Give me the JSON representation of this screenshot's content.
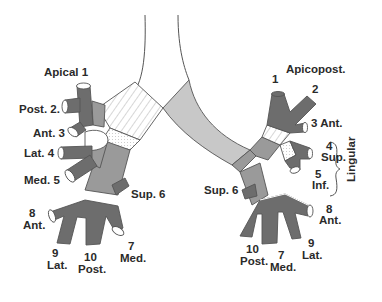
{
  "colors": {
    "background": "#ffffff",
    "outline": "#555555",
    "dark_segment": "#6d6d6d",
    "mid_segment": "#9a9a9a",
    "light_segment": "#c8c8c8",
    "pale_segment": "#e6e6e6",
    "label": "#2a2a2a"
  },
  "right_lung": {
    "labels": {
      "apical": "Apical 1",
      "posterior": "Post. 2.",
      "anterior": "Ant. 3",
      "lateral": "Lat. 4",
      "medial": "Med. 5",
      "superior": "Sup. 6",
      "anterior_basal_num": "8",
      "anterior_basal": "Ant.",
      "lateral_basal_num": "9",
      "lateral_basal": "Lat.",
      "posterior_basal_num": "10",
      "posterior_basal": "Post.",
      "medial_basal_num": "7",
      "medial_basal": "Med."
    }
  },
  "left_lung": {
    "labels": {
      "apicoposterior": "Apicopost.",
      "apical_num": "1",
      "posterior_num": "2",
      "anterior": "3 Ant.",
      "superior_lingular_num": "4",
      "superior_lingular": "Sup.",
      "inferior_lingular_num": "5",
      "inferior_lingular": "Inf.",
      "lingular_group": "Lingular",
      "superior": "Sup. 6",
      "anterior_basal_num": "8",
      "anterior_basal": "Ant.",
      "lateral_basal_num": "9",
      "lateral_basal": "Lat.",
      "posterior_basal_num": "10",
      "posterior_basal": "Post.",
      "medial_basal_num": "7",
      "medial_basal": "Med."
    }
  }
}
